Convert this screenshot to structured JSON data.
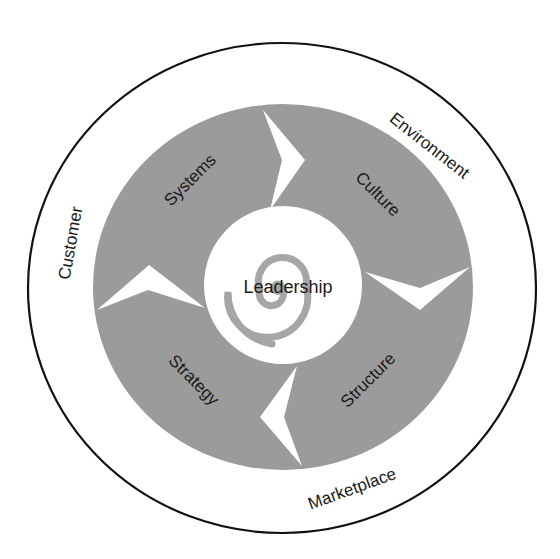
{
  "diagram": {
    "colors": {
      "background": "#ffffff",
      "outer_ring_stroke": "#111111",
      "disk_fill": "#9b9b9b",
      "spiral_fill": "#a6a6a6",
      "text": "#1a1a1a"
    },
    "center": {
      "label": "Leadership"
    },
    "inner_segments": [
      {
        "label": "Systems",
        "position": "upper-left"
      },
      {
        "label": "Culture",
        "position": "upper-right"
      },
      {
        "label": "Strategy",
        "position": "lower-left"
      },
      {
        "label": "Structure",
        "position": "lower-right"
      }
    ],
    "outer_labels": [
      {
        "label": "Environment",
        "position": "upper-right"
      },
      {
        "label": "Customer",
        "position": "left"
      },
      {
        "label": "Marketplace",
        "position": "bottom"
      }
    ],
    "arrows": [
      {
        "name": "top",
        "direction": "clockwise"
      },
      {
        "name": "right",
        "direction": "clockwise"
      },
      {
        "name": "bottom",
        "direction": "clockwise"
      },
      {
        "name": "left",
        "direction": "clockwise"
      }
    ]
  }
}
